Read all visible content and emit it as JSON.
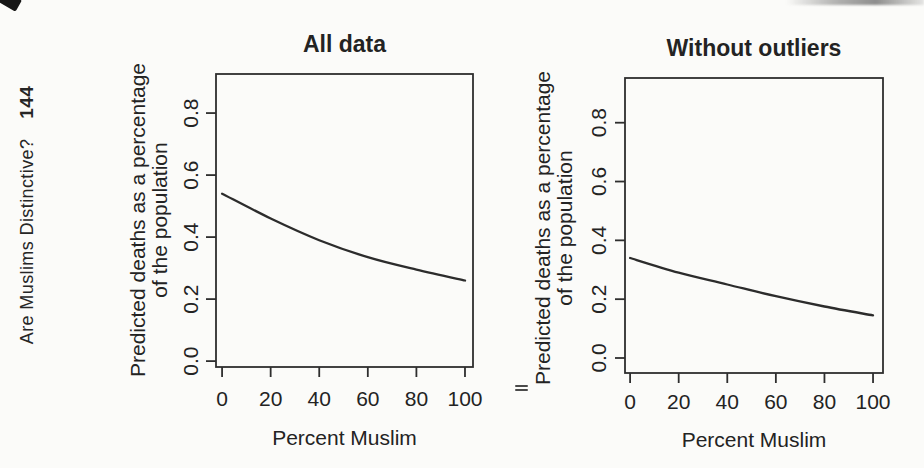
{
  "page": {
    "background_color": "#fbfbf9",
    "text_color": "#232323",
    "header": {
      "running_title": "Are Muslims Distinctive?",
      "page_number": "144"
    }
  },
  "chart_data": [
    {
      "type": "line",
      "title": "All data",
      "xlabel": "Percent Muslim",
      "ylabel_lines": [
        "Predicted deaths as a percentage",
        "of the population"
      ],
      "x": [
        0,
        20,
        40,
        60,
        80,
        100
      ],
      "values": [
        0.54,
        0.46,
        0.39,
        0.335,
        0.295,
        0.26
      ],
      "xticks": [
        "0",
        "20",
        "40",
        "60",
        "80",
        "100"
      ],
      "xtick_values": [
        0,
        20,
        40,
        60,
        80,
        100
      ],
      "yticks": [
        "0.0",
        "0.2",
        "0.4",
        "0.6",
        "0.8"
      ],
      "ytick_values": [
        0,
        0.2,
        0.4,
        0.6,
        0.8
      ],
      "xlim": [
        -2.5,
        103.3
      ],
      "ylim": [
        -0.019,
        0.926
      ],
      "grid": false,
      "legend": false,
      "line_color": "#2c2c2c",
      "frame_color": "#2e2e2e"
    },
    {
      "type": "line",
      "title": "Without outliers",
      "xlabel": "Percent Muslim",
      "ylabel_lines": [
        "Predicted deaths as a percentage",
        "of the population"
      ],
      "x": [
        0,
        20,
        40,
        60,
        80,
        100
      ],
      "values": [
        0.34,
        0.29,
        0.25,
        0.21,
        0.175,
        0.145
      ],
      "xticks": [
        "0",
        "20",
        "40",
        "60",
        "80",
        "100"
      ],
      "xtick_values": [
        0,
        20,
        40,
        60,
        80,
        100
      ],
      "yticks": [
        "0.0",
        "0.2",
        "0.4",
        "0.6",
        "0.8"
      ],
      "ytick_values": [
        0,
        0.2,
        0.4,
        0.6,
        0.8
      ],
      "xlim": [
        -2.1,
        104.1
      ],
      "ylim": [
        -0.051,
        0.952
      ],
      "grid": false,
      "legend": false,
      "line_color": "#2c2c2c",
      "frame_color": "#2e2e2e"
    }
  ]
}
